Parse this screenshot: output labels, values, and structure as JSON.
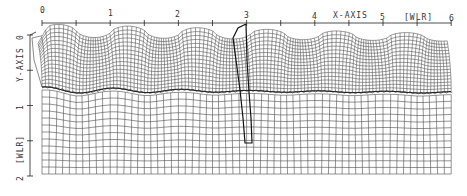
{
  "diagram": {
    "type": "deformed-grid",
    "x_axis": {
      "title": "X-AXIS",
      "unit": "[WLR]",
      "ticks": [
        "0",
        "1",
        "2",
        "3",
        "4",
        "5",
        "6"
      ],
      "range": [
        0,
        6
      ]
    },
    "y_axis": {
      "title": "Y-AXIS",
      "unit": "[WLR]",
      "ticks": [
        "0",
        "1",
        "2"
      ],
      "range": [
        0,
        2
      ]
    },
    "upper_layer": {
      "surface_crests_x": [
        0.25,
        1.25,
        2.25,
        3.05,
        4.0,
        5.05,
        6.0
      ],
      "surface_troughs_x": [
        0.75,
        1.75,
        2.7,
        3.55,
        4.55,
        5.55
      ]
    },
    "interface": {
      "approx_depth": 0.8,
      "marker": "scalloped"
    },
    "tracer": {
      "description": "bold material line near x=3",
      "x": 3.0
    },
    "colors": {
      "line": "#222222",
      "grid": "#3a3a3a",
      "background": "#ffffff"
    }
  }
}
